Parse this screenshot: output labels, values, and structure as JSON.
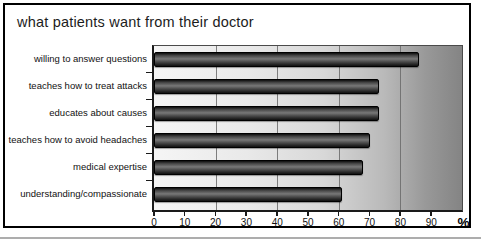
{
  "chart_data": {
    "type": "bar",
    "orientation": "horizontal",
    "title": "what patients want from their doctor",
    "categories": [
      "willing to answer questions",
      "teaches how to treat attacks",
      "educates about causes",
      "teaches how to avoid headaches",
      "medical expertise",
      "understanding/compassionate"
    ],
    "values": [
      86,
      73,
      73,
      70,
      68,
      61
    ],
    "xlabel": "%",
    "xlim": [
      0,
      100
    ],
    "xticks": [
      0,
      10,
      20,
      30,
      40,
      50,
      60,
      70,
      80,
      90
    ],
    "gridlines": [
      20,
      40,
      60,
      80
    ],
    "legend": "none",
    "grid": "vertical",
    "colors": {
      "bar": "#4a4a4a",
      "plot_bg_left": "#f5f5f5",
      "plot_bg_right": "#848484",
      "gridline": "#6a6a6a",
      "axis": "#1a1a1a",
      "frame_border": "#000000"
    }
  }
}
